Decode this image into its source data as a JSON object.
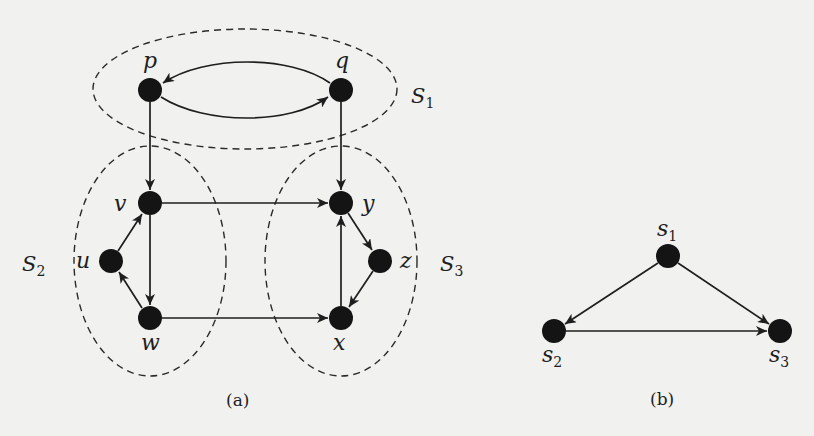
{
  "figure": {
    "panel_a": {
      "caption": "(a)",
      "nodes": [
        {
          "id": "p",
          "label": "p",
          "x": 150,
          "y": 90
        },
        {
          "id": "q",
          "label": "q",
          "x": 341,
          "y": 90
        },
        {
          "id": "v",
          "label": "v",
          "x": 150,
          "y": 203
        },
        {
          "id": "u",
          "label": "u",
          "x": 111,
          "y": 261
        },
        {
          "id": "w",
          "label": "w",
          "x": 150,
          "y": 318
        },
        {
          "id": "y",
          "label": "y",
          "x": 341,
          "y": 203
        },
        {
          "id": "z",
          "label": "z",
          "x": 380,
          "y": 261
        },
        {
          "id": "x",
          "label": "x",
          "x": 341,
          "y": 318
        }
      ],
      "edges": [
        {
          "from": "q",
          "to": "p",
          "curve": "upper"
        },
        {
          "from": "p",
          "to": "q",
          "curve": "lower"
        },
        {
          "from": "p",
          "to": "v"
        },
        {
          "from": "q",
          "to": "y"
        },
        {
          "from": "v",
          "to": "y"
        },
        {
          "from": "v",
          "to": "w"
        },
        {
          "from": "u",
          "to": "v"
        },
        {
          "from": "w",
          "to": "u"
        },
        {
          "from": "w",
          "to": "x"
        },
        {
          "from": "y",
          "to": "z"
        },
        {
          "from": "z",
          "to": "x"
        },
        {
          "from": "x",
          "to": "y"
        }
      ],
      "sets": [
        {
          "id": "S1",
          "name": "S",
          "sub": "1",
          "members": [
            "p",
            "q"
          ]
        },
        {
          "id": "S2",
          "name": "S",
          "sub": "2",
          "members": [
            "u",
            "v",
            "w"
          ]
        },
        {
          "id": "S3",
          "name": "S",
          "sub": "3",
          "members": [
            "x",
            "y",
            "z"
          ]
        }
      ]
    },
    "panel_b": {
      "caption": "(b)",
      "nodes": [
        {
          "id": "s1",
          "name": "s",
          "sub": "1",
          "x": 668,
          "y": 256
        },
        {
          "id": "s2",
          "name": "s",
          "sub": "2",
          "x": 554,
          "y": 331
        },
        {
          "id": "s3",
          "name": "s",
          "sub": "3",
          "x": 780,
          "y": 331
        }
      ],
      "edges": [
        {
          "from": "s1",
          "to": "s2"
        },
        {
          "from": "s1",
          "to": "s3"
        },
        {
          "from": "s2",
          "to": "s3"
        }
      ]
    }
  },
  "colors": {
    "background": "#f1f1ef",
    "ink": "#1e1e1e",
    "node_fill": "#141414"
  }
}
